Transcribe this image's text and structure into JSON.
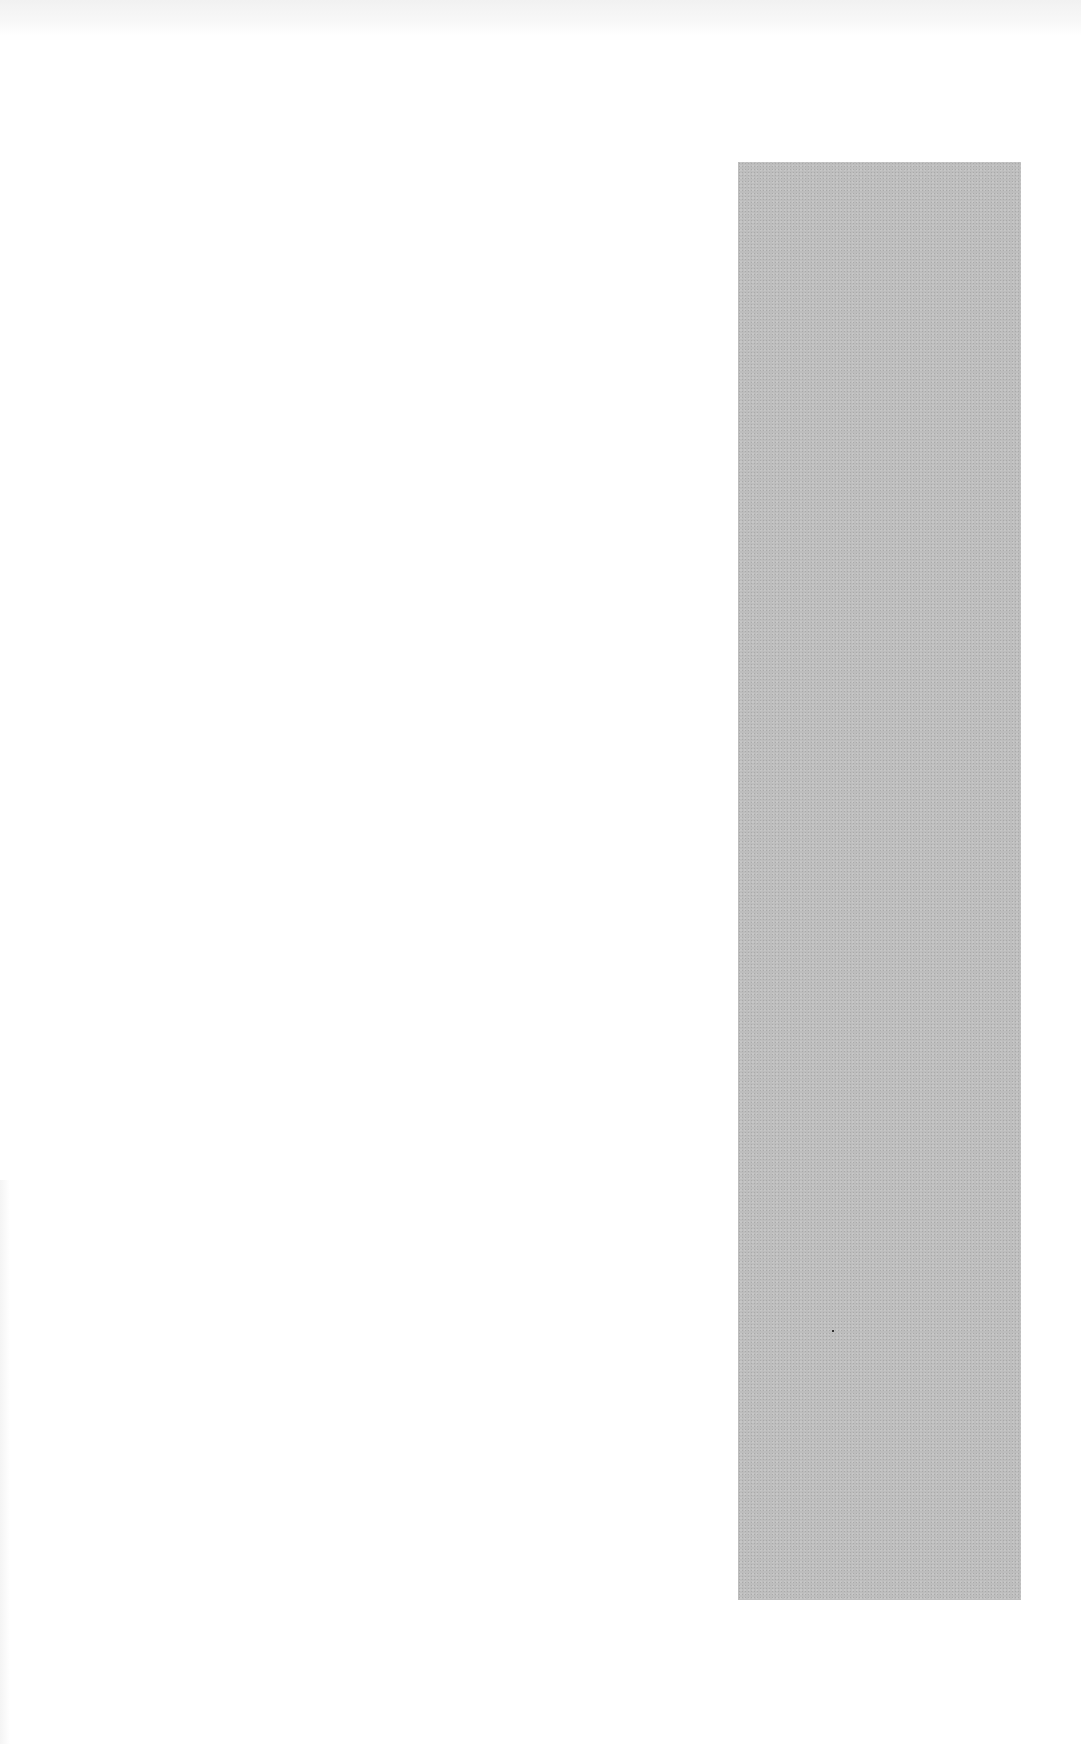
{
  "page": {
    "width": 1081,
    "height": 1744,
    "background_color": "#ffffff"
  },
  "gray_panel": {
    "color": "#bdbdbd",
    "x": 738,
    "y": 162,
    "width": 283,
    "height": 1438
  },
  "text": {
    "top_bleed_through": ""
  }
}
